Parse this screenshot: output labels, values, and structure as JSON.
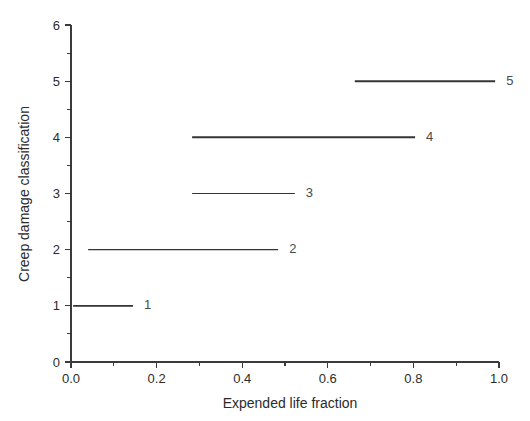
{
  "chart_data": {
    "type": "line",
    "title": "",
    "xlabel": "Expended life fraction",
    "ylabel": "Creep damage classification",
    "xlim": [
      0.0,
      1.0
    ],
    "ylim": [
      0,
      6
    ],
    "grid": false,
    "legend": "none",
    "xticks": [
      0.0,
      0.2,
      0.4,
      0.6,
      0.8,
      1.0
    ],
    "xticklabels": [
      "0.0",
      "0.2",
      "0.4",
      "0.6",
      "0.8",
      "1.0"
    ],
    "xminor_step": 0.1,
    "yticks": [
      0,
      1,
      2,
      3,
      4,
      5,
      6
    ],
    "yticklabels": [
      "0",
      "1",
      "2",
      "3",
      "4",
      "5",
      "6"
    ],
    "yminor_step": 0.5,
    "series": [
      {
        "name": "1",
        "label": "1",
        "y": 1,
        "x_start": 0.005,
        "x_end": 0.145,
        "color": "#343434",
        "linewidth": 1.7
      },
      {
        "name": "2",
        "label": "2",
        "y": 2,
        "x_start": 0.04,
        "x_end": 0.484,
        "color": "#8e8e8e",
        "linewidth": 1.2
      },
      {
        "name": "3",
        "label": "3",
        "y": 3,
        "x_start": 0.283,
        "x_end": 0.523,
        "color": "#8a8a8a",
        "linewidth": 1.2
      },
      {
        "name": "4",
        "label": "4",
        "y": 4,
        "x_start": 0.283,
        "x_end": 0.804,
        "color": "#2f2f2f",
        "linewidth": 2.0
      },
      {
        "name": "5",
        "label": "5",
        "y": 5,
        "x_start": 0.663,
        "x_end": 0.991,
        "color": "#2f2f2f",
        "linewidth": 2.0
      }
    ]
  },
  "axis_color": "#3a3a3a",
  "background_color": "#ffffff"
}
